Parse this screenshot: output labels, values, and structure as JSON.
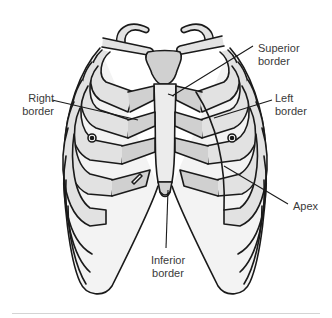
{
  "figure": {
    "labels": {
      "superior": "Superior\nborder",
      "right": "Right\nborder",
      "left": "Left\nborder",
      "apex": "Apex",
      "inferior": "Inferior\nborder"
    },
    "colors": {
      "outline": "#1a1a1a",
      "bone_fill": "#e2e2e2",
      "cartilage_fill": "#d0d0d0",
      "background": "#ffffff",
      "label_text": "#3a3a3a",
      "rule": "#d4d4d4"
    }
  }
}
